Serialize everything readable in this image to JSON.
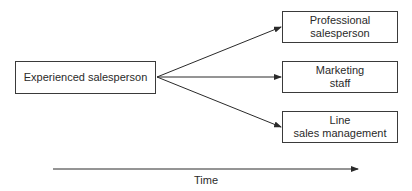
{
  "diagram": {
    "source": {
      "label": "Experienced salesperson"
    },
    "targets": [
      {
        "line1": "Professional",
        "line2": "salesperson"
      },
      {
        "line1": "Marketing",
        "line2": "staff"
      },
      {
        "line1": "Line",
        "line2": "sales management"
      }
    ],
    "axis": {
      "label": "Time"
    }
  }
}
